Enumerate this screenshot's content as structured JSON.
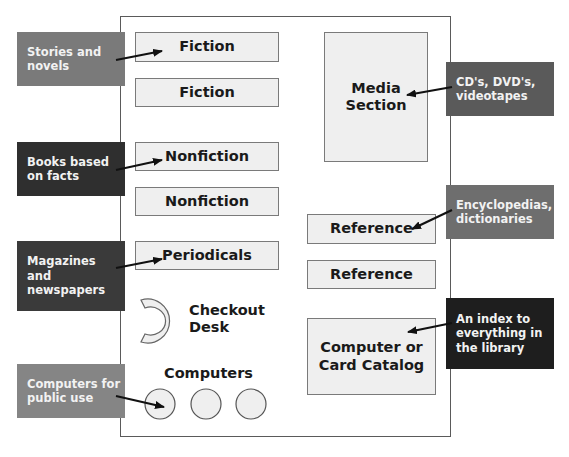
{
  "diagram": {
    "type": "library floor plan",
    "areas": {
      "fiction_1": "Fiction",
      "fiction_2": "Fiction",
      "nonfiction_1": "Nonfiction",
      "nonfiction_2": "Nonfiction",
      "periodicals": "Periodicals",
      "media_line1": "Media",
      "media_line2": "Section",
      "reference_1": "Reference",
      "reference_2": "Reference",
      "catalog_line1": "Computer or",
      "catalog_line2": "Card Catalog",
      "checkout_line1": "Checkout",
      "checkout_line2": "Desk",
      "computers": "Computers"
    },
    "callouts": {
      "fiction": {
        "lines": [
          "Stories and",
          "novels"
        ],
        "color": "#7a7a7a"
      },
      "nonfiction": {
        "lines": [
          "Books based",
          "on facts"
        ],
        "color": "#2f2f2f"
      },
      "periodicals": {
        "lines": [
          "Magazines",
          "and",
          "newspapers"
        ],
        "color": "#3a3a3a"
      },
      "computers": {
        "lines": [
          "Computers for",
          "public use"
        ],
        "color": "#858585"
      },
      "media": {
        "lines": [
          "CD's, DVD's,",
          "videotapes"
        ],
        "color": "#5a5a5a"
      },
      "reference": {
        "lines": [
          "Encyclopedias,",
          "dictionaries"
        ],
        "color": "#6e6e6e"
      },
      "catalog": {
        "lines": [
          "An index to",
          "everything in",
          "the library"
        ],
        "color": "#1e1e1e"
      }
    },
    "colors": {
      "shelf_fill": "#efefef",
      "shelf_border": "#7a7a7a",
      "wall": "#5a5a5a",
      "arrow": "#111111"
    }
  }
}
